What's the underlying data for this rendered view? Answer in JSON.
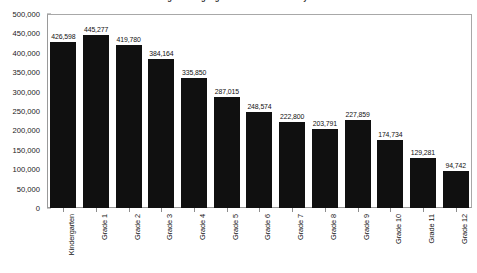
{
  "chart_data": {
    "type": "bar",
    "title": "United States English Language Learner Enrollment by Grade 1998-2005",
    "xlabel": "",
    "ylabel": "",
    "ylim": [
      0,
      500000
    ],
    "grid": false,
    "legend": null,
    "bar_color": "#101010",
    "categories": [
      "Kindergarten",
      "Grade 1",
      "Grade 2",
      "Grade 3",
      "Grade 4",
      "Grade 5",
      "Grade 6",
      "Grade 7",
      "Grade 8",
      "Grade 9",
      "Grade 10",
      "Grade 11",
      "Grade 12"
    ],
    "values": [
      426598,
      445277,
      419780,
      384164,
      335850,
      287015,
      248574,
      222800,
      203791,
      227859,
      174734,
      129281,
      94742
    ],
    "value_labels": [
      "426,598",
      "445,277",
      "419,780",
      "384,164",
      "335,850",
      "287,015",
      "248,574",
      "222,800",
      "203,791",
      "227,859",
      "174,734",
      "129,281",
      "94,742"
    ],
    "y_ticks": [
      500000,
      450000,
      400000,
      350000,
      300000,
      250000,
      200000,
      150000,
      100000,
      50000,
      0
    ],
    "y_tick_labels": [
      "500,000",
      "450,000",
      "400,000",
      "350,000",
      "300,000",
      "250,000",
      "200,000",
      "150,000",
      "100,000",
      "50,000",
      "0"
    ]
  }
}
